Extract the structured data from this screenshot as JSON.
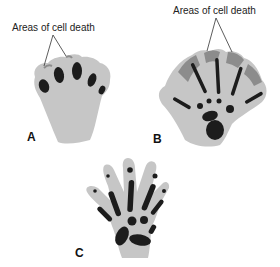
{
  "figure": {
    "colors": {
      "tissue": "#c6c6c6",
      "cell_death": "#8c8c8c",
      "cartilage": "#1c1c1c",
      "leader_line": "#333333"
    },
    "panels": [
      {
        "label": "A",
        "callout": "Areas of cell death"
      },
      {
        "label": "B",
        "callout": "Areas of cell death"
      },
      {
        "label": "C"
      }
    ]
  }
}
